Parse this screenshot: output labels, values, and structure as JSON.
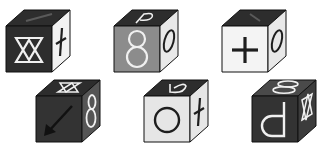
{
  "puzzle": {
    "description": "Six cubes with symbols on visible faces (front, top, right)",
    "colors": {
      "black": "#2b2b2b",
      "dark": "#3a3a3a",
      "gray": "#8a8a8a",
      "light": "#e6e6e6",
      "white": "#f4f4f4",
      "symbol_white": "#f0f0f0",
      "symbol_black": "#1e1e1e",
      "edge": "#111111"
    },
    "cubes": [
      {
        "id": "cube-1",
        "front": {
          "fill": "#2d2d2d",
          "symbol": "double-triangle-hourglass",
          "symbol_color": "#f0f0f0"
        },
        "top": {
          "fill": "#2d2d2d",
          "symbol": "diagonal-line",
          "symbol_color": "#555555"
        },
        "right": {
          "fill": "#f2f2f2",
          "symbol": "dagger-cross",
          "symbol_color": "#1e1e1e"
        }
      },
      {
        "id": "cube-2",
        "front": {
          "fill": "#8c8c8c",
          "symbol": "eight",
          "symbol_color": "#f0f0f0"
        },
        "top": {
          "fill": "#2d2d2d",
          "symbol": "p-hook",
          "symbol_color": "#f0f0f0"
        },
        "right": {
          "fill": "#e8e8e8",
          "symbol": "zero",
          "symbol_color": "#1e1e1e"
        }
      },
      {
        "id": "cube-3",
        "front": {
          "fill": "#f4f4f4",
          "symbol": "plus",
          "symbol_color": "#1e1e1e"
        },
        "top": {
          "fill": "#2d2d2d",
          "symbol": "diagonal-line",
          "symbol_color": "#555555"
        },
        "right": {
          "fill": "#e8e8e8",
          "symbol": "zero",
          "symbol_color": "#1e1e1e"
        }
      },
      {
        "id": "cube-4",
        "front": {
          "fill": "#333333",
          "symbol": "arrow-down-left",
          "symbol_color": "#111111"
        },
        "top": {
          "fill": "#2d2d2d",
          "symbol": "double-triangle-hourglass",
          "symbol_color": "#f0f0f0"
        },
        "right": {
          "fill": "#555555",
          "symbol": "eight",
          "symbol_color": "#f0f0f0"
        }
      },
      {
        "id": "cube-5",
        "front": {
          "fill": "#e6e6e6",
          "symbol": "circle",
          "symbol_color": "#1e1e1e"
        },
        "top": {
          "fill": "#2d2d2d",
          "symbol": "p-hook",
          "symbol_color": "#f0f0f0"
        },
        "right": {
          "fill": "#e6e6e6",
          "symbol": "dagger-cross",
          "symbol_color": "#1e1e1e"
        }
      },
      {
        "id": "cube-6",
        "front": {
          "fill": "#333333",
          "symbol": "d-letter",
          "symbol_color": "#f0f0f0"
        },
        "top": {
          "fill": "#4a4a4a",
          "symbol": "eight",
          "symbol_color": "#f0f0f0"
        },
        "right": {
          "fill": "#3c3c3c",
          "symbol": "double-triangle-hourglass",
          "symbol_color": "#f0f0f0"
        }
      }
    ]
  }
}
